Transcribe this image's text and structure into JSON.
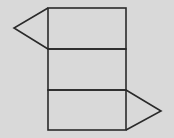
{
  "diagram": {
    "background": "#d9d9d9",
    "stroke": "#2a2a2a",
    "stroke_width": 1.6,
    "rectangles": [
      {
        "name": "face-top",
        "x": 48,
        "y": 8,
        "w": 78,
        "h": 41
      },
      {
        "name": "face-middle",
        "x": 48,
        "y": 49,
        "w": 78,
        "h": 41
      },
      {
        "name": "face-bottom",
        "x": 48,
        "y": 90,
        "w": 78,
        "h": 40
      }
    ],
    "triangles": [
      {
        "name": "triangle-left",
        "points": "48,8 14,28 48,49"
      },
      {
        "name": "triangle-right",
        "points": "126,90 161,111 126,130"
      }
    ]
  }
}
